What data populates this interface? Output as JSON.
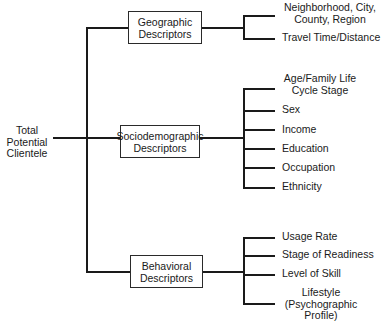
{
  "root": {
    "label_lines": [
      "Total",
      "Potential",
      "Clientele"
    ]
  },
  "categories": [
    {
      "title_lines": [
        "Geographic",
        "Descriptors"
      ],
      "items": [
        {
          "lines": [
            "Neighborhood, City,",
            "County, Region"
          ]
        },
        {
          "lines": [
            "Travel Time/Distance"
          ]
        }
      ]
    },
    {
      "title_lines": [
        "Sociodemographic",
        "Descriptors"
      ],
      "items": [
        {
          "lines": [
            "Age/Family Life",
            "Cycle Stage"
          ]
        },
        {
          "lines": [
            "Sex"
          ]
        },
        {
          "lines": [
            "Income"
          ]
        },
        {
          "lines": [
            "Education"
          ]
        },
        {
          "lines": [
            "Occupation"
          ]
        },
        {
          "lines": [
            "Ethnicity"
          ]
        }
      ]
    },
    {
      "title_lines": [
        "Behavioral",
        "Descriptors"
      ],
      "items": [
        {
          "lines": [
            "Usage Rate"
          ]
        },
        {
          "lines": [
            "Stage of Readiness"
          ]
        },
        {
          "lines": [
            "Level of Skill"
          ]
        },
        {
          "lines": [
            "Lifestyle",
            "(Psychographic",
            "Profile)"
          ]
        }
      ]
    }
  ]
}
